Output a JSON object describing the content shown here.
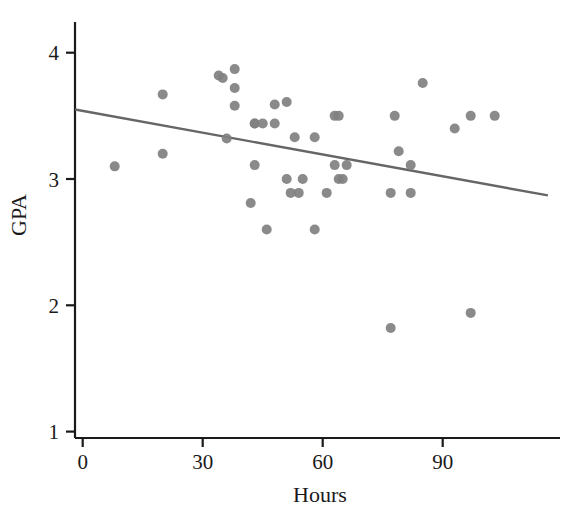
{
  "chart_data": {
    "type": "scatter",
    "title": "",
    "xlabel": "Hours",
    "ylabel": "GPA",
    "xlim": [
      -5,
      120
    ],
    "ylim": [
      0.88,
      4.22
    ],
    "grid": false,
    "legend": "none",
    "x_ticks": [
      0,
      30,
      60,
      90
    ],
    "y_ticks": [
      1,
      2,
      3,
      4
    ],
    "x_tick_labels": [
      "0",
      "30",
      "60",
      "90"
    ],
    "y_tick_labels": [
      "1",
      "2",
      "3",
      "4"
    ],
    "point_color": "#808080",
    "line_color": "#666666",
    "axis_color": "#1a1a1a",
    "marker_size": 10,
    "points": [
      {
        "x": 8,
        "y": 3.1
      },
      {
        "x": 20,
        "y": 3.67
      },
      {
        "x": 20,
        "y": 3.2
      },
      {
        "x": 34,
        "y": 3.82
      },
      {
        "x": 35,
        "y": 3.8
      },
      {
        "x": 38,
        "y": 3.87
      },
      {
        "x": 38,
        "y": 3.72
      },
      {
        "x": 38,
        "y": 3.58
      },
      {
        "x": 36,
        "y": 3.32
      },
      {
        "x": 43,
        "y": 3.44
      },
      {
        "x": 43,
        "y": 3.11
      },
      {
        "x": 42,
        "y": 2.81
      },
      {
        "x": 46,
        "y": 2.6
      },
      {
        "x": 43,
        "y": 3.44
      },
      {
        "x": 45,
        "y": 3.44
      },
      {
        "x": 48,
        "y": 3.44
      },
      {
        "x": 48,
        "y": 3.59
      },
      {
        "x": 51,
        "y": 3.61
      },
      {
        "x": 53,
        "y": 3.33
      },
      {
        "x": 51,
        "y": 3.0
      },
      {
        "x": 52,
        "y": 2.89
      },
      {
        "x": 54,
        "y": 2.89
      },
      {
        "x": 55,
        "y": 3.0
      },
      {
        "x": 58,
        "y": 3.33
      },
      {
        "x": 58,
        "y": 2.6
      },
      {
        "x": 61,
        "y": 2.89
      },
      {
        "x": 63,
        "y": 3.11
      },
      {
        "x": 64,
        "y": 3.0
      },
      {
        "x": 65,
        "y": 3.0
      },
      {
        "x": 66,
        "y": 3.11
      },
      {
        "x": 63,
        "y": 3.5
      },
      {
        "x": 64,
        "y": 3.5
      },
      {
        "x": 77,
        "y": 2.89
      },
      {
        "x": 77,
        "y": 1.82
      },
      {
        "x": 78,
        "y": 3.5
      },
      {
        "x": 79,
        "y": 3.22
      },
      {
        "x": 82,
        "y": 3.11
      },
      {
        "x": 82,
        "y": 2.89
      },
      {
        "x": 85,
        "y": 3.76
      },
      {
        "x": 93,
        "y": 3.4
      },
      {
        "x": 97,
        "y": 3.5
      },
      {
        "x": 97,
        "y": 1.94
      },
      {
        "x": 103,
        "y": 3.5
      }
    ],
    "trend_line": {
      "label": "least-squares regression line",
      "x_start": -1.9,
      "y_start": 3.55,
      "x_end": 116.3,
      "y_end": 2.87
    }
  }
}
